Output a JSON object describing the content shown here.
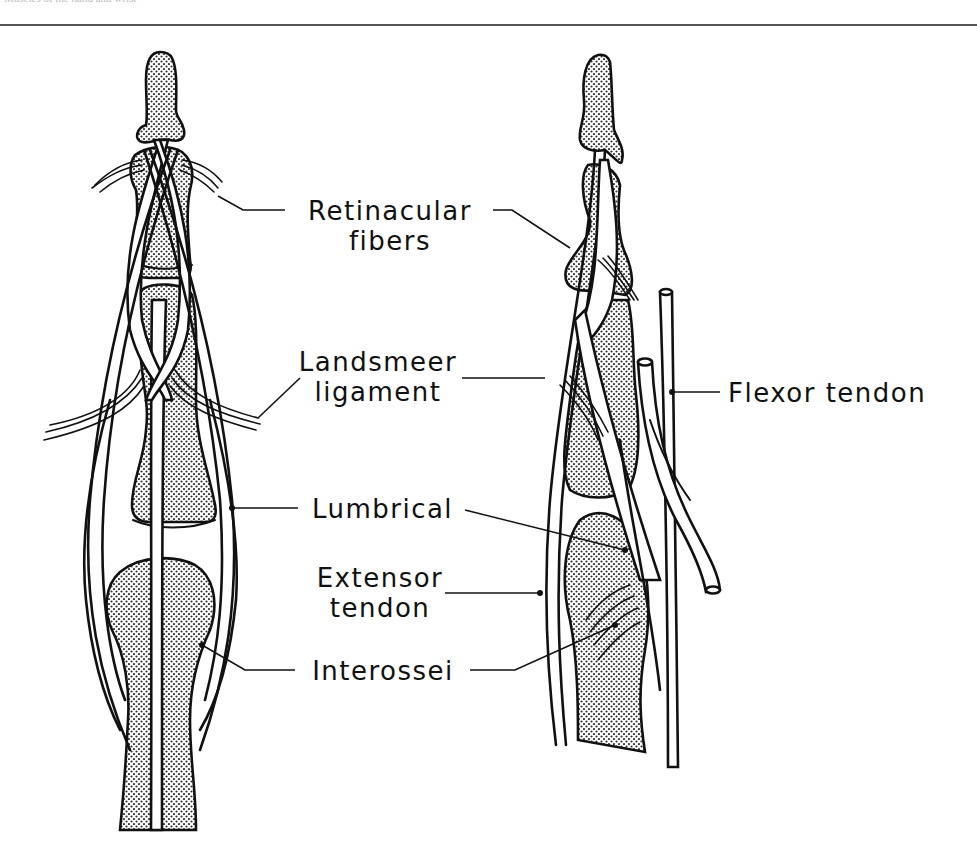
{
  "header": {
    "running_title": "Muscles of the hand and wrist"
  },
  "figure": {
    "views": [
      "dorsal view of finger",
      "lateral view of finger"
    ],
    "colors": {
      "ink": "#111111",
      "bone_fill": "#d8d8d8",
      "background": "#ffffff"
    },
    "labels": {
      "retinacular_1": "Retinacular",
      "retinacular_2": "fibers",
      "landsmeer_1": "Landsmeer",
      "landsmeer_2": "ligament",
      "flexor": "Flexor tendon",
      "lumbrical": "Lumbrical",
      "extensor_1": "Extensor",
      "extensor_2": "tendon",
      "interossei": "Interossei"
    }
  }
}
